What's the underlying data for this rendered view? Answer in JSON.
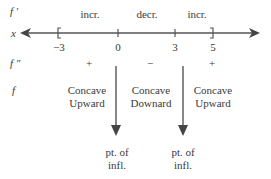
{
  "diagram": {
    "row_labels": {
      "fprime": "f ′",
      "x": "x",
      "fdoubleprime": "f ″",
      "f": "f"
    },
    "fprime_signs": [
      "incr.",
      "decr.",
      "incr."
    ],
    "ticks": [
      "−3",
      "0",
      "3",
      "5"
    ],
    "endpoints": {
      "left": "[",
      "right": "]"
    },
    "fdoubleprime_signs": [
      "+",
      "−",
      "+"
    ],
    "concavity": [
      {
        "line1": "Concave",
        "line2": "Upward"
      },
      {
        "line1": "Concave",
        "line2": "Downard"
      },
      {
        "line1": "Concave",
        "line2": "Upward"
      }
    ],
    "inflection_points": [
      {
        "line1": "pt. of",
        "line2": "infl."
      },
      {
        "line1": "pt. of",
        "line2": "infl."
      }
    ],
    "colors": {
      "line": "#555555",
      "text": "#3a3a3a"
    }
  }
}
